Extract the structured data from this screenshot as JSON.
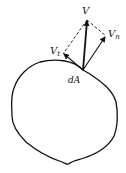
{
  "diagram": {
    "labels": {
      "velocity": "V",
      "normal": "V",
      "normal_sub": "n",
      "tangential": "V",
      "tangential_sub": "t",
      "area_element": "dA"
    },
    "colors": {
      "stroke": "#111111",
      "background": "#ffffff"
    }
  }
}
